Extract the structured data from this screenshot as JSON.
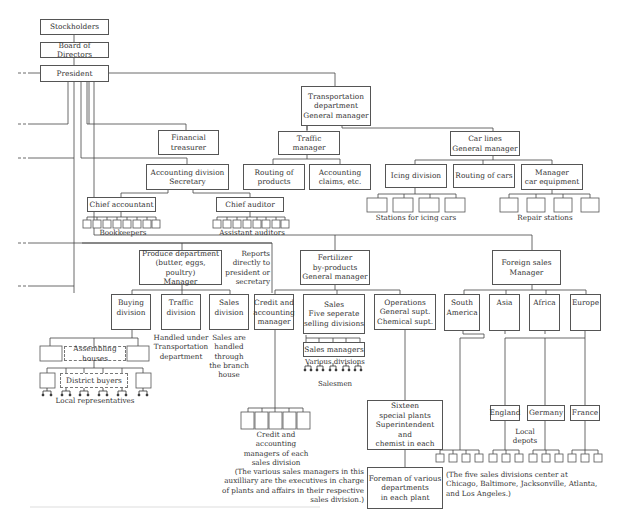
{
  "diagram": {
    "type": "organizational-chart",
    "nodes": {
      "stockholders": "Stockholders",
      "board": "Board of Directors",
      "president": "President",
      "transportation": "Transportation\ndepartment\nGeneral manager",
      "financial": "Financial\ntreasurer",
      "traffic_manager": "Traffic manager",
      "car_lines": "Car lines\nGeneral manager",
      "routing_products": "Routing of\nproducts",
      "accounting_claims": "Accounting\nclaims, etc.",
      "icing_division": "Icing division",
      "routing_cars": "Routing of cars",
      "manager_car_equipment": "Manager\ncar equipment",
      "accounting_division": "Accounting division\nSecretary",
      "chief_accountant": "Chief accountant",
      "chief_auditor": "Chief auditor",
      "produce": "Produce department\n(butter, eggs, poultry)\nManager",
      "fertilizer": "Fertilizer\nby-products\nGeneral manager",
      "foreign_sales": "Foreign sales\nManager",
      "buying_division": "Buying\ndivision",
      "traffic_division": "Traffic\ndivision",
      "sales_division": "Sales\ndivision",
      "credit_accounting": "Credit and\naccounting\nmanager",
      "sales_five": "Sales\nFive seperate\nselling divisions",
      "operations": "Operations\nGeneral supt.\nChemical supt.",
      "south_america": "South\nAmerica",
      "asia": "Asia",
      "africa": "Africa",
      "europe": "Europe",
      "assembling_houses": "Assembling houses",
      "district_buyers": "District buyers",
      "sales_managers": "Sales managers",
      "england": "England",
      "germany": "Germany",
      "france": "France",
      "sixteen_plants": "Sixteen\nspecial plants\nSuperintendent and\nchemist in each",
      "foreman": "Foreman of various\ndepartments\nin each plant"
    },
    "labels": {
      "bookkeepers": "Bookkeepers",
      "assistant_auditors": "Assistant auditors",
      "stations_icing": "Stations for icing cars",
      "repair_stations": "Repair stations",
      "reports_directly": "Reports\ndirectly to\npresident or\nsecretary",
      "handled_transport": "Handled under\nTransportation\ndepartment",
      "sales_handled": "Sales are\nhandled\nthrough\nthe branch\nhouse",
      "various_divisions": "Various divisions",
      "salesmen": "Salesmen",
      "local_representatives": "Local representatives",
      "credit_managers_each": "Credit and accounting\nmanagers of each\nsales division",
      "local_depots": "Local\ndepots",
      "note_sales_managers": "(The various sales managers in this\nauxilliary are the executives in charge\nof plants and affairs in their respective\nsales division.)",
      "note_five_divisions": "(The five sales divisions center at\nChicago, Baltimore, Jacksonville, Atlanta,\nand Los Angeles.)"
    }
  }
}
